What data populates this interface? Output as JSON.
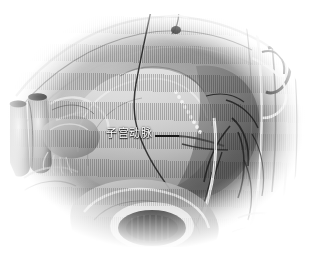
{
  "figure": {
    "type": "anatomical-illustration",
    "palette": "grayscale",
    "background_color": "#ffffff",
    "label_color": "#fdfdfd",
    "leader_line_color": "#181818",
    "dashed_line_color": "#f2f2f2"
  },
  "annotations": {
    "uterine_artery_label": "子宫动脉"
  },
  "structures": {
    "dashed_incision_points": 9,
    "suture_threads": 2,
    "vessel_strands": 11
  }
}
